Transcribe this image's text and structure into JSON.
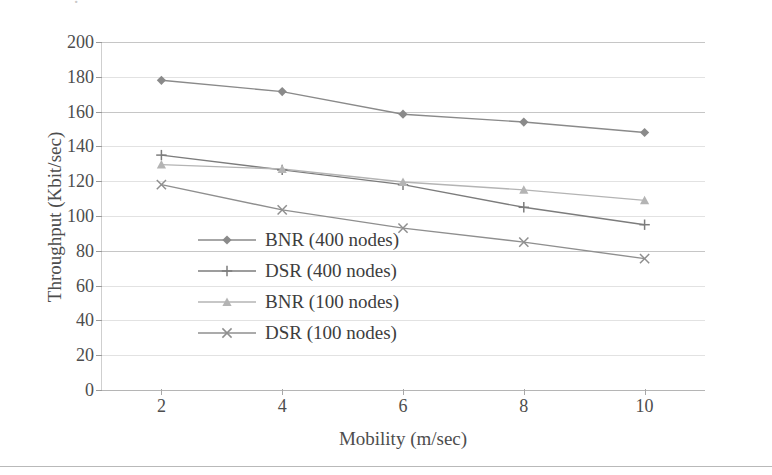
{
  "figure": {
    "top_artifact": "·",
    "bottom_rule": true
  },
  "chart_data": {
    "type": "line",
    "title": "",
    "xlabel": "Mobility (m/sec)",
    "ylabel": "Throughput (Kbit/sec)",
    "x": [
      2,
      4,
      6,
      8,
      10
    ],
    "xtick_labels": [
      "2",
      "4",
      "6",
      "8",
      "10"
    ],
    "ytick_labels": [
      "0",
      "20",
      "40",
      "60",
      "80",
      "100",
      "120",
      "140",
      "160",
      "180",
      "200"
    ],
    "yticks": [
      0,
      20,
      40,
      60,
      80,
      100,
      120,
      140,
      160,
      180,
      200
    ],
    "xlim": [
      1,
      11
    ],
    "ylim": [
      0,
      200
    ],
    "grid": true,
    "legend_position": "center-left-inside",
    "series": [
      {
        "name": "BNR (400 nodes)",
        "values": [
          178,
          171.5,
          158.5,
          154,
          148
        ],
        "marker": "diamond",
        "color": "#8a8a8a"
      },
      {
        "name": "DSR (400 nodes)",
        "values": [
          135,
          126.5,
          118,
          105,
          95
        ],
        "marker": "plus",
        "color": "#7c7c7c"
      },
      {
        "name": "BNR (100 nodes)",
        "values": [
          129.5,
          127,
          119.5,
          115,
          109
        ],
        "marker": "triangle",
        "color": "#b4b4b4"
      },
      {
        "name": "DSR (100 nodes)",
        "values": [
          118,
          103.5,
          93,
          85,
          75.5
        ],
        "marker": "x",
        "color": "#8f8f8f"
      }
    ]
  }
}
